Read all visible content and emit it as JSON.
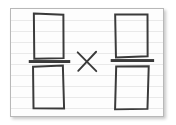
{
  "canvas": {
    "width": 176,
    "height": 125,
    "background_color": "#ffffff"
  },
  "card": {
    "label": "ruled index card",
    "x": 10,
    "y": 8,
    "width": 154,
    "height": 109,
    "paper_color": "#fdfdfd",
    "border_color": "#b8b8b8",
    "rule_line_color": "#e9e9e9",
    "rule_line_spacing": 11,
    "rule_line_count": 9,
    "shadow": "2px 2px 3px rgba(0,0,0,0.22)"
  },
  "drawing": {
    "description": "Hand-drawn multiplication of two fractions, each fraction drawn as an empty rectangle over an empty rectangle separated by a thick fraction bar",
    "ink_color": "#3a3a3a",
    "stroke_width": 2,
    "expression": "□/□ × □/□",
    "operator": "×",
    "operator_name": "multiplication-sign",
    "elements": [
      {
        "name": "left-fraction",
        "numerator": {
          "name": "left-numerator-box",
          "value": "",
          "x": 33,
          "y": 13,
          "width": 30,
          "height": 45
        },
        "fraction_bar": {
          "name": "left-fraction-bar",
          "x": 28,
          "y": 60,
          "width": 42,
          "height": 3
        },
        "denominator": {
          "name": "left-denominator-box",
          "value": "",
          "x": 33,
          "y": 66,
          "width": 30,
          "height": 44
        }
      },
      {
        "name": "multiplication-operator",
        "glyph": "×",
        "x": 78,
        "y": 52,
        "width": 18,
        "height": 19
      },
      {
        "name": "right-fraction",
        "numerator": {
          "name": "right-numerator-box",
          "value": "",
          "x": 116,
          "y": 13,
          "width": 33,
          "height": 44
        },
        "fraction_bar": {
          "name": "right-fraction-bar",
          "x": 111,
          "y": 59,
          "width": 44,
          "height": 3
        },
        "denominator": {
          "name": "right-denominator-box",
          "value": "",
          "x": 116,
          "y": 66,
          "width": 33,
          "height": 44
        }
      }
    ]
  }
}
